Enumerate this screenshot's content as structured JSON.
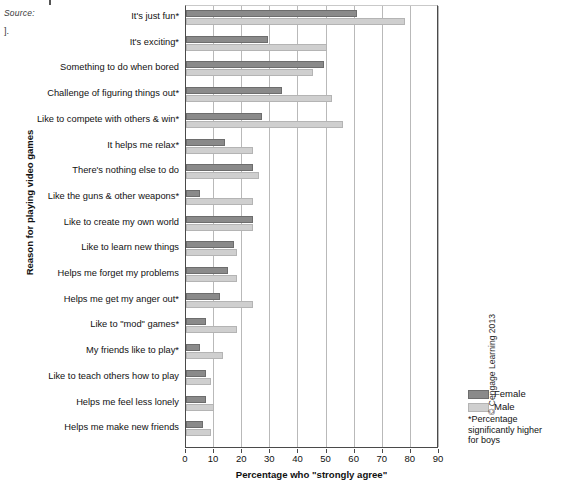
{
  "page": {
    "source_fragment": "Source:",
    "tail_fragment": "].",
    "copyright": "© Cengage Learning 2013"
  },
  "axes": {
    "y_title": "Reason for playing video games",
    "x_title": "Percentage who \"strongly agree\"",
    "x_ticks": [
      "0",
      "10",
      "20",
      "30",
      "40",
      "50",
      "60",
      "70",
      "80",
      "90"
    ]
  },
  "legend": {
    "items": [
      {
        "label": "Female",
        "color": "#8a8a8a"
      },
      {
        "label": "Male",
        "color": "#cfcfcf"
      }
    ],
    "footnote": "*Percentage significantly higher for boys"
  },
  "chart_data": {
    "type": "bar",
    "orientation": "horizontal",
    "title": "",
    "xlabel": "Percentage who \"strongly agree\"",
    "ylabel": "Reason for playing video games",
    "xlim": [
      0,
      90
    ],
    "grid": true,
    "legend_position": "bottom-right",
    "categories": [
      "It's just fun*",
      "It's exciting*",
      "Something to do when bored",
      "Challenge of figuring things out*",
      "Like to compete with others & win*",
      "It helps me relax*",
      "There's nothing else to do",
      "Like the guns & other weapons*",
      "Like to create my own world",
      "Like to learn new things",
      "Helps me forget my problems",
      "Helps me get my anger out*",
      "Like to \"mod\" games*",
      "My friends like to play*",
      "Like to teach others how to play",
      "Helps me feel less lonely",
      "Helps me make new friends"
    ],
    "series": [
      {
        "name": "Female",
        "color": "#8a8a8a",
        "values": [
          61,
          29,
          49,
          34,
          27,
          14,
          24,
          5,
          24,
          17,
          15,
          12,
          7,
          5,
          7,
          7,
          6
        ]
      },
      {
        "name": "Male",
        "color": "#cfcfcf",
        "values": [
          78,
          50,
          45,
          52,
          56,
          24,
          26,
          24,
          24,
          18,
          18,
          24,
          18,
          13,
          9,
          10,
          9
        ]
      }
    ]
  }
}
